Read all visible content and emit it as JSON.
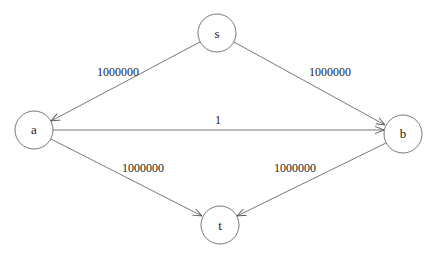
{
  "diagram": {
    "type": "directed-graph",
    "nodes": [
      {
        "id": "s",
        "label": "s",
        "x": 217,
        "y": 33
      },
      {
        "id": "a",
        "label": "a",
        "x": 34,
        "y": 130
      },
      {
        "id": "b",
        "label": "b",
        "x": 403,
        "y": 134
      },
      {
        "id": "t",
        "label": "t",
        "x": 220,
        "y": 225
      }
    ],
    "edges": [
      {
        "from": "s",
        "to": "a",
        "label": "1000000"
      },
      {
        "from": "s",
        "to": "b",
        "label": "1000000"
      },
      {
        "from": "a",
        "to": "b",
        "label": "1"
      },
      {
        "from": "a",
        "to": "t",
        "label": "1000000"
      },
      {
        "from": "b",
        "to": "t",
        "label": "1000000"
      }
    ]
  }
}
